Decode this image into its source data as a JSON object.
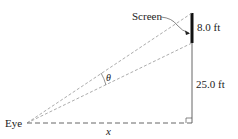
{
  "diagram": {
    "type": "geometry-figure",
    "labels": {
      "screen": "Screen",
      "screen_height": "8.0 ft",
      "base_height": "25.0 ft",
      "eye": "Eye",
      "distance": "x",
      "angle": "θ"
    },
    "colors": {
      "line": "#555555",
      "screen_bar": "#111111",
      "text": "#222222"
    }
  }
}
